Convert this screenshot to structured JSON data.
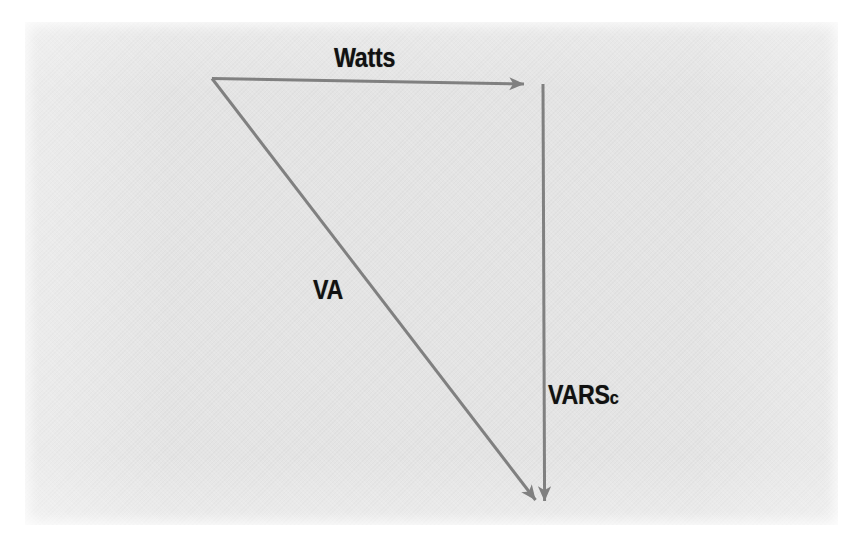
{
  "figure": {
    "type": "power-triangle-vector-diagram",
    "background_color": "#e4e4e4",
    "page_color": "#ffffff",
    "stroke_color": "#808080",
    "label_color": "#111111",
    "labels": {
      "watts": "Watts",
      "va": "VA",
      "vars_main": "VARS",
      "vars_sub": "c"
    },
    "vectors": [
      {
        "name": "watts-vector",
        "label": "Watts",
        "from": [
          212,
          78
        ],
        "to": [
          535,
          84
        ],
        "arrowhead": "end",
        "orientation": "horizontal-right"
      },
      {
        "name": "varsc-vector",
        "label": "VARSc",
        "from": [
          543,
          84
        ],
        "to": [
          545,
          512
        ],
        "arrowhead": "end",
        "orientation": "vertical-down"
      },
      {
        "name": "va-vector",
        "label": "VA",
        "from": [
          212,
          78
        ],
        "to": [
          545,
          512
        ],
        "arrowhead": "end",
        "orientation": "diagonal-down-right"
      }
    ]
  }
}
